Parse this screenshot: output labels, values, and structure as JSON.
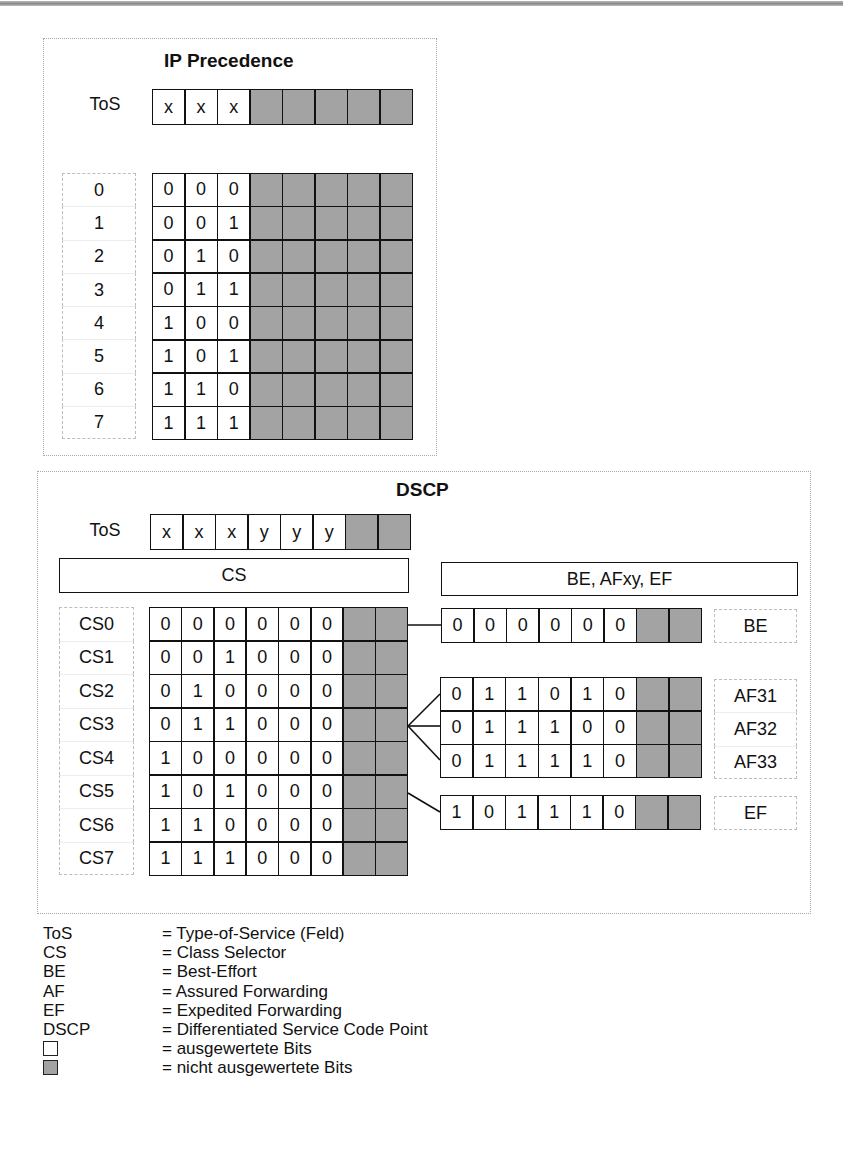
{
  "colors": {
    "evaluated_bit": "#ffffff",
    "unevaluated_bit": "#a3a3a3",
    "border": "#111111",
    "dotted_frame": "#a8a8a8"
  },
  "ip_precedence": {
    "title": "IP Precedence",
    "tos_label": "ToS",
    "tos_bits": [
      "x",
      "x",
      "x",
      "",
      "",
      "",
      "",
      ""
    ],
    "rows": [
      {
        "label": "0",
        "bits": [
          "0",
          "0",
          "0"
        ]
      },
      {
        "label": "1",
        "bits": [
          "0",
          "0",
          "1"
        ]
      },
      {
        "label": "2",
        "bits": [
          "0",
          "1",
          "0"
        ]
      },
      {
        "label": "3",
        "bits": [
          "0",
          "1",
          "1"
        ]
      },
      {
        "label": "4",
        "bits": [
          "1",
          "0",
          "0"
        ]
      },
      {
        "label": "5",
        "bits": [
          "1",
          "0",
          "1"
        ]
      },
      {
        "label": "6",
        "bits": [
          "1",
          "1",
          "0"
        ]
      },
      {
        "label": "7",
        "bits": [
          "1",
          "1",
          "1"
        ]
      }
    ]
  },
  "dscp": {
    "title": "DSCP",
    "tos_label": "ToS",
    "tos_bits": [
      "x",
      "x",
      "x",
      "y",
      "y",
      "y",
      "",
      ""
    ],
    "cs_bar": "CS",
    "phb_bar": "BE, AFxy, EF",
    "cs_rows": [
      {
        "label": "CS0",
        "bits": [
          "0",
          "0",
          "0",
          "0",
          "0",
          "0"
        ]
      },
      {
        "label": "CS1",
        "bits": [
          "0",
          "0",
          "1",
          "0",
          "0",
          "0"
        ]
      },
      {
        "label": "CS2",
        "bits": [
          "0",
          "1",
          "0",
          "0",
          "0",
          "0"
        ]
      },
      {
        "label": "CS3",
        "bits": [
          "0",
          "1",
          "1",
          "0",
          "0",
          "0"
        ]
      },
      {
        "label": "CS4",
        "bits": [
          "1",
          "0",
          "0",
          "0",
          "0",
          "0"
        ]
      },
      {
        "label": "CS5",
        "bits": [
          "1",
          "0",
          "1",
          "0",
          "0",
          "0"
        ]
      },
      {
        "label": "CS6",
        "bits": [
          "1",
          "1",
          "0",
          "0",
          "0",
          "0"
        ]
      },
      {
        "label": "CS7",
        "bits": [
          "1",
          "1",
          "1",
          "0",
          "0",
          "0"
        ]
      }
    ],
    "be": {
      "label": "BE",
      "bits": [
        "0",
        "0",
        "0",
        "0",
        "0",
        "0"
      ],
      "from": "CS0"
    },
    "af": {
      "from": "CS3",
      "rows": [
        {
          "label": "AF31",
          "bits": [
            "0",
            "1",
            "1",
            "0",
            "1",
            "0"
          ]
        },
        {
          "label": "AF32",
          "bits": [
            "0",
            "1",
            "1",
            "1",
            "0",
            "0"
          ]
        },
        {
          "label": "AF33",
          "bits": [
            "0",
            "1",
            "1",
            "1",
            "1",
            "0"
          ]
        }
      ]
    },
    "ef": {
      "label": "EF",
      "bits": [
        "1",
        "0",
        "1",
        "1",
        "1",
        "0"
      ],
      "from": "CS5"
    }
  },
  "legend": [
    {
      "term": "ToS",
      "desc": "= Type-of-Service (Feld)"
    },
    {
      "term": "CS",
      "desc": "= Class Selector"
    },
    {
      "term": "BE",
      "desc": "= Best-Effort"
    },
    {
      "term": "AF",
      "desc": "= Assured Forwarding"
    },
    {
      "term": "EF",
      "desc": "= Expedited Forwarding"
    },
    {
      "term": "DSCP",
      "desc": "= Differentiated Service Code Point"
    },
    {
      "swatch": "white",
      "desc": "= ausgewertete Bits"
    },
    {
      "swatch": "grey",
      "desc": "= nicht ausgewertete Bits"
    }
  ]
}
